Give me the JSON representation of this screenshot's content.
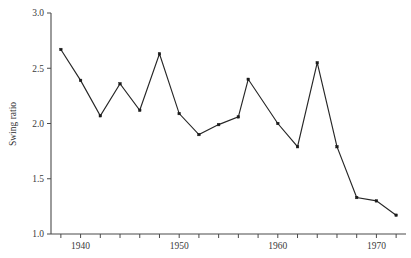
{
  "chart_data": {
    "type": "line",
    "title": "",
    "xlabel": "",
    "ylabel": "Swing ratio",
    "xlim": [
      1937,
      1973
    ],
    "ylim": [
      1.0,
      3.0
    ],
    "grid": false,
    "legend": false,
    "x_tick_labels": [
      "1940",
      "1950",
      "1960",
      "1970"
    ],
    "x_tick_values": [
      1940,
      1950,
      1960,
      1970
    ],
    "x_minor_tick_values": [
      1938,
      1942,
      1944,
      1946,
      1948,
      1952,
      1954,
      1956,
      1958,
      1962,
      1964,
      1966,
      1968,
      1972
    ],
    "y_tick_labels": [
      "1.0",
      "1.5",
      "2.0",
      "2.5",
      "3.0"
    ],
    "y_tick_values": [
      1.0,
      1.5,
      2.0,
      2.5,
      3.0
    ],
    "marker": "square",
    "line_color": "#262626",
    "marker_color": "#1a1a1a",
    "x": [
      1938,
      1940,
      1942,
      1944,
      1946,
      1948,
      1950,
      1952,
      1954,
      1956,
      1957,
      1960,
      1962,
      1964,
      1966,
      1968,
      1970,
      1972
    ],
    "values": [
      2.67,
      2.39,
      2.07,
      2.36,
      2.12,
      2.63,
      2.09,
      1.9,
      1.99,
      2.06,
      2.4,
      2.0,
      1.79,
      2.55,
      1.79,
      1.33,
      1.3,
      1.17
    ],
    "series": [
      {
        "name": "Swing ratio",
        "points": [
          {
            "x": 1938,
            "y": 2.67
          },
          {
            "x": 1940,
            "y": 2.39
          },
          {
            "x": 1942,
            "y": 2.07
          },
          {
            "x": 1944,
            "y": 2.36
          },
          {
            "x": 1946,
            "y": 2.12
          },
          {
            "x": 1948,
            "y": 2.63
          },
          {
            "x": 1950,
            "y": 2.09
          },
          {
            "x": 1952,
            "y": 1.9
          },
          {
            "x": 1954,
            "y": 1.99
          },
          {
            "x": 1956,
            "y": 2.06
          },
          {
            "x": 1957,
            "y": 2.4
          },
          {
            "x": 1960,
            "y": 2.0
          },
          {
            "x": 1962,
            "y": 1.79
          },
          {
            "x": 1964,
            "y": 2.55
          },
          {
            "x": 1966,
            "y": 1.79
          },
          {
            "x": 1968,
            "y": 1.33
          },
          {
            "x": 1970,
            "y": 1.3
          },
          {
            "x": 1972,
            "y": 1.17
          }
        ]
      }
    ]
  }
}
